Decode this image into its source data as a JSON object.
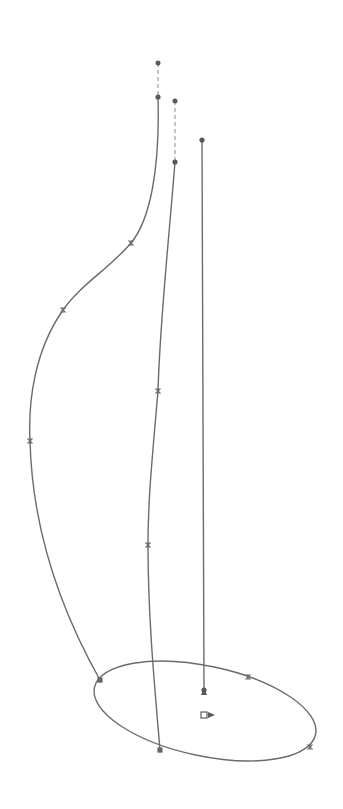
{
  "diagram": {
    "type": "cad-sketch",
    "colors": {
      "line": "#6b6b6b",
      "point": "#5a5a5a",
      "background": "#ffffff"
    },
    "guide_curves": [
      {
        "name": "spline-outer",
        "path": "M158,97 C160,170 150,220 131,243 C110,268 80,285 63,310 C35,350 28,400 30,441 C32,520 55,600 100,680",
        "control_points": [
          [
            158,
            97
          ],
          [
            131,
            243
          ],
          [
            63,
            310
          ],
          [
            30,
            441
          ],
          [
            100,
            680
          ]
        ],
        "end_extension": [
          [
            158,
            63
          ],
          [
            158,
            97
          ]
        ]
      },
      {
        "name": "spline-middle",
        "path": "M175,162 C168,250 160,320 158,391 C152,460 148,500 148,545 C148,620 155,690 160,750",
        "control_points": [
          [
            175,
            162
          ],
          [
            158,
            391
          ],
          [
            148,
            545
          ],
          [
            160,
            750
          ]
        ],
        "end_extension": [
          [
            175,
            101
          ],
          [
            175,
            162
          ]
        ]
      },
      {
        "name": "line-center",
        "path": "M202,140 L204,690",
        "control_points": [
          [
            202,
            140
          ],
          [
            204,
            690
          ]
        ]
      }
    ],
    "profile": {
      "name": "ellipse-base",
      "cx": 205,
      "cy": 711,
      "rx": 113,
      "ry": 45,
      "rotation": 12,
      "markers": [
        [
          100,
          680
        ],
        [
          248,
          677
        ],
        [
          310,
          747
        ],
        [
          160,
          750
        ]
      ]
    },
    "origin": {
      "x": 204,
      "y": 715,
      "arrow_tip": [
        204,
        693
      ]
    }
  }
}
